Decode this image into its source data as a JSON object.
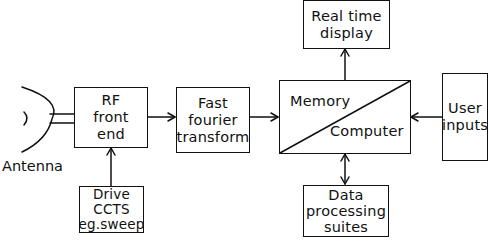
{
  "diagram": {
    "antenna": {
      "label": "Antenna"
    },
    "blocks": {
      "rf_front_end": {
        "lines": [
          "RF",
          "front",
          "end"
        ]
      },
      "fft": {
        "lines": [
          "Fast",
          "fourier",
          "transform"
        ]
      },
      "memory_computer": {
        "top_label": "Memory",
        "bottom_label": "Computer"
      },
      "real_time_display": {
        "lines": [
          "Real time",
          "display"
        ]
      },
      "user_inputs": {
        "lines": [
          "User",
          "inputs"
        ]
      },
      "drive_ccts": {
        "lines": [
          "Drive",
          "CCTS",
          "eg.sweep"
        ]
      },
      "data_processing": {
        "lines": [
          "Data",
          "processing",
          "suites"
        ]
      }
    },
    "connections": [
      {
        "from": "antenna",
        "to": "rf_front_end",
        "type": "double-line"
      },
      {
        "from": "rf_front_end",
        "to": "fft",
        "type": "arrow"
      },
      {
        "from": "fft",
        "to": "memory_computer",
        "type": "arrow"
      },
      {
        "from": "memory_computer",
        "to": "real_time_display",
        "type": "arrow"
      },
      {
        "from": "user_inputs",
        "to": "memory_computer",
        "type": "arrow"
      },
      {
        "from": "drive_ccts",
        "to": "rf_front_end",
        "type": "arrow"
      },
      {
        "from": "memory_computer",
        "to": "data_processing",
        "type": "bidirectional-arrow"
      }
    ]
  }
}
